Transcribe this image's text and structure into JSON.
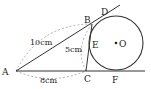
{
  "diagram": {
    "points": {
      "A": {
        "label": "A",
        "x": 16,
        "y": 71
      },
      "B": {
        "label": "B",
        "x": 92,
        "y": 24
      },
      "C": {
        "label": "C",
        "x": 86,
        "y": 71
      },
      "D": {
        "label": "D",
        "x": 104,
        "y": 14
      },
      "E": {
        "label": "E",
        "x": 89,
        "y": 43
      },
      "F": {
        "label": "F",
        "x": 116,
        "y": 71
      },
      "O": {
        "label": "O",
        "x": 116,
        "y": 43
      }
    },
    "circle": {
      "center": "O",
      "radius": 27
    },
    "measurements": {
      "AB": "10cm",
      "BC": "5cm",
      "AC": "8cm"
    },
    "colors": {
      "stroke": "#333333",
      "dashed": "#999999",
      "text": "#222222"
    }
  }
}
